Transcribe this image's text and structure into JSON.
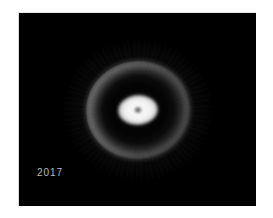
{
  "figure": {
    "panel_background": "#000000",
    "page_background": "#ffffff",
    "annotation": {
      "year": "2017"
    }
  },
  "chart_data": {
    "type": "heatmap",
    "title": "",
    "subtitle": "",
    "xlabel": "",
    "ylabel": "",
    "legend": [],
    "annotations": [
      {
        "text": "2017",
        "position": "bottom-left",
        "color": "#b9b9b9"
      }
    ],
    "colormap": "greyscale",
    "grid": false,
    "structures": [
      {
        "name": "central-core",
        "shape": "ellipse",
        "center_x": 0.5,
        "center_y": 0.5,
        "radius_x": 0.084,
        "radius_y": 0.077,
        "peak_intensity": 1.0
      },
      {
        "name": "inner-pinhole",
        "shape": "ellipse",
        "center_x": 0.5,
        "center_y": 0.5,
        "radius_x": 0.017,
        "radius_y": 0.018,
        "peak_intensity": 0.2
      },
      {
        "name": "dark-gap",
        "shape": "annulus",
        "center_x": 0.5,
        "center_y": 0.5,
        "inner_radius": 0.09,
        "outer_radius": 0.155,
        "peak_intensity": 0.02
      },
      {
        "name": "outer-ring",
        "shape": "annulus",
        "center_x": 0.5,
        "center_y": 0.5,
        "inner_radius": 0.16,
        "outer_radius": 0.26,
        "peak_intensity": 0.5,
        "brightest_limb": "upper-left"
      },
      {
        "name": "diffuse-halo",
        "shape": "ellipse",
        "center_x": 0.5,
        "center_y": 0.5,
        "radius_x": 0.3,
        "radius_y": 0.34,
        "peak_intensity": 0.05
      }
    ],
    "intensity_range": [
      0,
      1
    ],
    "values": [
      1.0,
      0.2,
      0.02,
      0.5,
      0.05
    ]
  }
}
